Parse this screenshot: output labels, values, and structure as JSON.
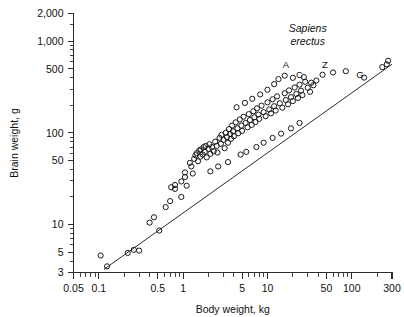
{
  "chart_data": {
    "type": "scatter",
    "title": "",
    "xlabel": "Body weight, kg",
    "ylabel": "Brain weight, g",
    "xscale": "log",
    "yscale": "log",
    "xlim": [
      0.05,
      300
    ],
    "ylim": [
      3,
      2000
    ],
    "grid": false,
    "legend": null,
    "xticks": [
      {
        "value": 0.05,
        "label": "0.05"
      },
      {
        "value": 0.1,
        "label": "0.1"
      },
      {
        "value": 0.5,
        "label": "0.5"
      },
      {
        "value": 1,
        "label": "1"
      },
      {
        "value": 5,
        "label": "5"
      },
      {
        "value": 10,
        "label": "10"
      },
      {
        "value": 50,
        "label": "50"
      },
      {
        "value": 100,
        "label": "100"
      },
      {
        "value": 300,
        "label": "300"
      }
    ],
    "xminorticks": [
      0.06,
      0.07,
      0.08,
      0.09,
      0.2,
      0.3,
      0.4,
      0.6,
      0.7,
      0.8,
      0.9,
      2,
      3,
      4,
      6,
      7,
      8,
      9,
      20,
      30,
      40,
      60,
      70,
      80,
      90,
      200
    ],
    "yticks": [
      {
        "value": 3,
        "label": "3"
      },
      {
        "value": 5,
        "label": "5"
      },
      {
        "value": 10,
        "label": "10"
      },
      {
        "value": 50,
        "label": "50"
      },
      {
        "value": 100,
        "label": "100"
      },
      {
        "value": 500,
        "label": "500"
      },
      {
        "value": 1000,
        "label": "1,000"
      },
      {
        "value": 2000,
        "label": "2,000"
      }
    ],
    "yminorticks": [
      4,
      6,
      7,
      8,
      9,
      20,
      30,
      40,
      60,
      70,
      80,
      90,
      200,
      300,
      400,
      600,
      700,
      800,
      900,
      1500
    ],
    "reference_line": {
      "name": "allometric-reference-line",
      "x1": 0.115,
      "y1": 3.25,
      "x2": 300,
      "y2": 560
    },
    "annotations": [
      {
        "text": "Sapiens",
        "x": 30,
        "y": 1250,
        "style": "italic"
      },
      {
        "text": "erectus",
        "x": 30,
        "y": 900,
        "style": "italic"
      },
      {
        "text": "A",
        "x": 16.5,
        "y": 505,
        "style": "letter"
      },
      {
        "text": "C",
        "x": 24.0,
        "y": 395,
        "style": "letter"
      },
      {
        "text": "Z",
        "x": 48.0,
        "y": 505,
        "style": "letter"
      },
      {
        "text": "G",
        "x": 125.0,
        "y": 400,
        "style": "letter"
      }
    ],
    "points": [
      [
        0.105,
        4.6
      ],
      [
        0.125,
        3.5
      ],
      [
        0.22,
        4.9
      ],
      [
        0.26,
        5.3
      ],
      [
        0.3,
        5.2
      ],
      [
        0.52,
        8.6
      ],
      [
        0.62,
        15.5
      ],
      [
        0.7,
        18.0
      ],
      [
        0.72,
        25.5
      ],
      [
        0.8,
        24.5
      ],
      [
        0.8,
        27.0
      ],
      [
        0.95,
        20.0
      ],
      [
        0.95,
        29.5
      ],
      [
        1.1,
        26.5
      ],
      [
        1.25,
        43.0
      ],
      [
        1.2,
        47.0
      ],
      [
        1.35,
        52.0
      ],
      [
        1.4,
        57.0
      ],
      [
        1.45,
        60.0
      ],
      [
        1.5,
        49.0
      ],
      [
        1.55,
        64.0
      ],
      [
        1.6,
        55.0
      ],
      [
        1.62,
        66.0
      ],
      [
        1.7,
        58.0
      ],
      [
        1.75,
        70.0
      ],
      [
        1.8,
        62.0
      ],
      [
        1.85,
        72.0
      ],
      [
        1.9,
        54.0
      ],
      [
        2.0,
        67.0
      ],
      [
        2.05,
        75.0
      ],
      [
        2.1,
        59.0
      ],
      [
        2.2,
        70.0
      ],
      [
        2.3,
        63.0
      ],
      [
        2.4,
        80.0
      ],
      [
        2.5,
        72.0
      ],
      [
        2.55,
        61.0
      ],
      [
        2.7,
        88.0
      ],
      [
        2.8,
        76.0
      ],
      [
        2.85,
        95.0
      ],
      [
        3.0,
        84.0
      ],
      [
        3.1,
        68.0
      ],
      [
        3.2,
        100.0
      ],
      [
        3.3,
        90.0
      ],
      [
        3.4,
        78.0
      ],
      [
        3.5,
        110.0
      ],
      [
        3.6,
        97.0
      ],
      [
        3.7,
        86.0
      ],
      [
        3.8,
        120.0
      ],
      [
        3.9,
        104.0
      ],
      [
        4.0,
        92.0
      ],
      [
        4.2,
        130.0
      ],
      [
        4.4,
        112.0
      ],
      [
        4.5,
        99.0
      ],
      [
        4.7,
        140.0
      ],
      [
        4.9,
        120.0
      ],
      [
        5.0,
        105.0
      ],
      [
        5.2,
        150.0
      ],
      [
        5.5,
        128.0
      ],
      [
        5.8,
        115.0
      ],
      [
        6.0,
        160.0
      ],
      [
        6.2,
        138.0
      ],
      [
        6.5,
        122.0
      ],
      [
        6.8,
        172.0
      ],
      [
        7.0,
        148.0
      ],
      [
        7.2,
        131.0
      ],
      [
        7.5,
        185.0
      ],
      [
        7.8,
        158.0
      ],
      [
        8.0,
        142.0
      ],
      [
        8.5,
        198.0
      ],
      [
        9.0,
        168.0
      ],
      [
        9.5,
        152.0
      ],
      [
        10.0,
        215.0
      ],
      [
        10.5,
        180.0
      ],
      [
        11.0,
        163.0
      ],
      [
        11.5,
        232.0
      ],
      [
        12.0,
        195.0
      ],
      [
        12.5,
        175.0
      ],
      [
        13.0,
        250.0
      ],
      [
        14.0,
        210.0
      ],
      [
        15.0,
        188.0
      ],
      [
        16.0,
        270.0
      ],
      [
        16.5,
        228.0
      ],
      [
        17.5,
        205.0
      ],
      [
        18.0,
        290.0
      ],
      [
        19.0,
        245.0
      ],
      [
        20.0,
        222.0
      ],
      [
        21.0,
        312.0
      ],
      [
        22.0,
        265.0
      ],
      [
        23.0,
        240.0
      ],
      [
        24.0,
        335.0
      ],
      [
        25.0,
        288.0
      ],
      [
        26.0,
        258.0
      ],
      [
        28.0,
        360.0
      ],
      [
        30.0,
        310.0
      ],
      [
        32.0,
        280.0
      ],
      [
        35.0,
        330.0
      ],
      [
        2.1,
        38.0
      ],
      [
        2.6,
        43.0
      ],
      [
        3.4,
        48.0
      ],
      [
        1.05,
        37.0
      ],
      [
        4.8,
        58.0
      ],
      [
        5.6,
        62.0
      ],
      [
        7.4,
        70.0
      ],
      [
        9.0,
        78.0
      ],
      [
        11.5,
        88.0
      ],
      [
        14.5,
        98.0
      ],
      [
        19.0,
        112.0
      ],
      [
        24.0,
        128.0
      ],
      [
        0.45,
        12.0
      ],
      [
        0.4,
        10.5
      ],
      [
        1.05,
        33.0
      ],
      [
        1.3,
        36.0
      ],
      [
        45.0,
        430.0
      ],
      [
        60.0,
        455.0
      ],
      [
        85.0,
        470.0
      ],
      [
        140.0,
        400.0
      ],
      [
        230.0,
        520.0
      ],
      [
        260.0,
        560.0
      ],
      [
        270.0,
        610.0
      ],
      [
        13.5,
        385.0
      ],
      [
        16.0,
        420.0
      ],
      [
        20.0,
        398.0
      ],
      [
        27.0,
        405.0
      ],
      [
        33.0,
        352.0
      ],
      [
        38.0,
        372.0
      ],
      [
        12.0,
        340.0
      ],
      [
        10.0,
        295.0
      ],
      [
        8.2,
        262.0
      ],
      [
        6.6,
        235.0
      ],
      [
        5.4,
        212.0
      ],
      [
        4.3,
        190.0
      ]
    ]
  }
}
